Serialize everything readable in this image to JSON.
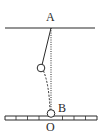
{
  "figure": {
    "corner_label": ")",
    "points": {
      "A": "A",
      "B": "B",
      "O": "O"
    },
    "colors": {
      "ink": "#2a2a2a",
      "background": "#ffffff"
    },
    "elements": {
      "ceiling": "horizontal support line",
      "string": "solid line from A to displaced bob",
      "vertical_reference": "dotted vertical line from A to O",
      "swing_path": "dashed arc from displaced bob to B",
      "bob_displaced": "small circle",
      "bob_rest": "small circle at B",
      "ruler": "horizontal scale with tick marks"
    }
  }
}
